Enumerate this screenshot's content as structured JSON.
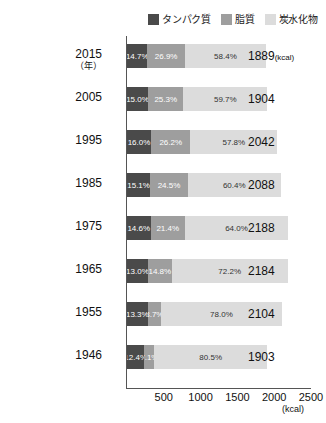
{
  "chart_data": {
    "type": "bar",
    "orientation": "horizontal",
    "stacked": true,
    "title": "",
    "xlabel": "(kcal)",
    "ylabel": "(年)",
    "xlim": [
      0,
      2500
    ],
    "xticks": [
      "500",
      "1000",
      "1500",
      "2000",
      "2500"
    ],
    "grid": false,
    "legend_position": "top-right",
    "categories": [
      "2015",
      "2005",
      "1995",
      "1985",
      "1975",
      "1965",
      "1955",
      "1946"
    ],
    "series": [
      {
        "name": "タンパク質",
        "color": "#4a4a4a",
        "values": [
          14.7,
          15.0,
          16.0,
          15.1,
          14.6,
          13.0,
          13.3,
          12.4
        ],
        "labels": [
          "14.7%",
          "15.0%",
          "16.0%",
          "15.1%",
          "14.6%",
          "13.0%",
          "13.3%",
          "12.4%"
        ]
      },
      {
        "name": "脂質",
        "color": "#9e9e9e",
        "values": [
          26.9,
          25.3,
          26.2,
          24.5,
          21.4,
          14.8,
          8.7,
          7.1
        ],
        "labels": [
          "26.9%",
          "25.3%",
          "26.2%",
          "24.5%",
          "21.4%",
          "14.8%",
          "8.7%",
          "7.1%"
        ]
      },
      {
        "name": "炭水化物",
        "color": "#dcdcdc",
        "values": [
          58.4,
          59.7,
          57.8,
          60.4,
          64.0,
          72.2,
          78.0,
          80.5
        ],
        "labels": [
          "58.4%",
          "59.7%",
          "57.8%",
          "60.4%",
          "64.0%",
          "72.2%",
          "78.0%",
          "80.5%"
        ]
      }
    ],
    "totals": [
      1889,
      1904,
      2042,
      2088,
      2188,
      2184,
      2104,
      1903
    ],
    "total_labels": [
      "1889",
      "1904",
      "2042",
      "2088",
      "2188",
      "2184",
      "2104",
      "1903"
    ],
    "total_unit": "(kcal)"
  },
  "legend": {
    "items": [
      {
        "label": "タンパク質",
        "color": "#4a4a4a"
      },
      {
        "label": "脂質",
        "color": "#9e9e9e"
      },
      {
        "label": "炭水化物",
        "color": "#dcdcdc"
      }
    ]
  },
  "axis": {
    "year_unit": "（年）",
    "x_unit": "(kcal)",
    "ticks": [
      "500",
      "1000",
      "1500",
      "2000",
      "2500"
    ]
  },
  "footnote": {
    "text": ""
  }
}
